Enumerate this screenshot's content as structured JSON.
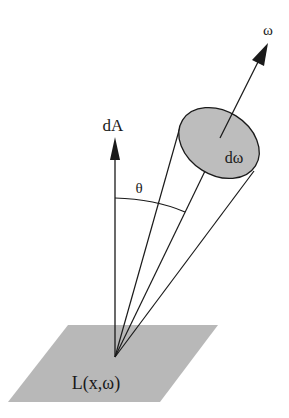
{
  "diagram": {
    "type": "radiance-solid-angle",
    "labels": {
      "omega_direction": "ω",
      "solid_angle": "dω",
      "area_normal": "dA",
      "angle": "θ",
      "radiance": "L(x,ω)"
    },
    "colors": {
      "background": "#ffffff",
      "stroke": "#1a1a1a",
      "surface_fill": "#b8b8b8",
      "ellipse_fill": "#bdbdbd"
    }
  }
}
